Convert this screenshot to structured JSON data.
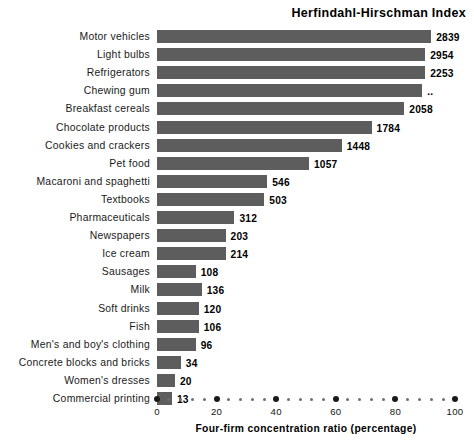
{
  "chart_data": {
    "type": "bar",
    "orientation": "horizontal",
    "title": "Herfindahl-Hirschman Index",
    "xlabel": "Four-firm concentration ratio (percentage)",
    "ylabel": "",
    "xlim": [
      0,
      100
    ],
    "grid": false,
    "legend": null,
    "bar_color": "#5d5d5d",
    "x_ticks_major": [
      0,
      20,
      40,
      60,
      80,
      100
    ],
    "x_tick_labels": [
      "0",
      "20",
      "40",
      "60",
      "80",
      "100"
    ],
    "x_ticks_minor_step": 4,
    "value_label_note": "Right-hand bold numbers are Herfindahl-Hirschman Index values; bar lengths are the four-firm concentration ratio in percent.",
    "categories": [
      "Motor vehicles",
      "Light bulbs",
      "Refrigerators",
      "Chewing gum",
      "Breakfast cereals",
      "Chocolate products",
      "Cookies and crackers",
      "Pet food",
      "Macaroni and spaghetti",
      "Textbooks",
      "Pharmaceuticals",
      "Newspapers",
      "Ice cream",
      "Sausages",
      "Milk",
      "Soft drinks",
      "Fish",
      "Men's and boy's clothing",
      "Concrete blocks and bricks",
      "Women's dresses",
      "Commercial printing"
    ],
    "values": [
      92,
      90,
      90,
      89,
      83,
      72,
      62,
      51,
      37,
      36,
      26,
      23,
      23,
      13,
      15,
      14,
      14,
      13,
      8,
      6,
      5
    ],
    "hhi_labels": [
      "2839",
      "2954",
      "2253",
      "..",
      "2058",
      "1784",
      "1448",
      "1057",
      "546",
      "503",
      "312",
      "203",
      "214",
      "108",
      "136",
      "120",
      "106",
      "96",
      "34",
      "20",
      "13"
    ],
    "rows": [
      {
        "label": "Motor vehicles",
        "ratio": 92,
        "hhi": "2839"
      },
      {
        "label": "Light bulbs",
        "ratio": 90,
        "hhi": "2954"
      },
      {
        "label": "Refrigerators",
        "ratio": 90,
        "hhi": "2253"
      },
      {
        "label": "Chewing gum",
        "ratio": 89,
        "hhi": ".."
      },
      {
        "label": "Breakfast cereals",
        "ratio": 83,
        "hhi": "2058"
      },
      {
        "label": "Chocolate products",
        "ratio": 72,
        "hhi": "1784"
      },
      {
        "label": "Cookies and crackers",
        "ratio": 62,
        "hhi": "1448"
      },
      {
        "label": "Pet food",
        "ratio": 51,
        "hhi": "1057"
      },
      {
        "label": "Macaroni and spaghetti",
        "ratio": 37,
        "hhi": "546"
      },
      {
        "label": "Textbooks",
        "ratio": 36,
        "hhi": "503"
      },
      {
        "label": "Pharmaceuticals",
        "ratio": 26,
        "hhi": "312"
      },
      {
        "label": "Newspapers",
        "ratio": 23,
        "hhi": "203"
      },
      {
        "label": "Ice cream",
        "ratio": 23,
        "hhi": "214"
      },
      {
        "label": "Sausages",
        "ratio": 13,
        "hhi": "108"
      },
      {
        "label": "Milk",
        "ratio": 15,
        "hhi": "136"
      },
      {
        "label": "Soft drinks",
        "ratio": 14,
        "hhi": "120"
      },
      {
        "label": "Fish",
        "ratio": 14,
        "hhi": "106"
      },
      {
        "label": "Men's and boy's clothing",
        "ratio": 13,
        "hhi": "96"
      },
      {
        "label": "Concrete blocks and bricks",
        "ratio": 8,
        "hhi": "34"
      },
      {
        "label": "Women's dresses",
        "ratio": 6,
        "hhi": "20"
      },
      {
        "label": "Commercial printing",
        "ratio": 5,
        "hhi": "13"
      }
    ]
  }
}
